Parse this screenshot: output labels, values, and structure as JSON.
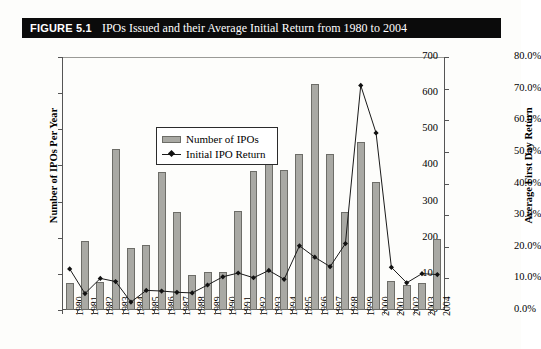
{
  "figure": {
    "label": "FIGURE 5.1",
    "title": "IPOs Issued and their Average Initial Return from 1980 to 2004"
  },
  "legend": {
    "bar_series_label": "Number of IPOs",
    "line_series_label": "Initial IPO Return"
  },
  "axes": {
    "left_title": "Number of IPOs Per Year",
    "right_title": "Average First Day Return",
    "left_ticks": [
      "0",
      "100",
      "200",
      "300",
      "400",
      "500",
      "600",
      "700"
    ],
    "right_ticks": [
      "0.0%",
      "10.0%",
      "20.0%",
      "30.0%",
      "40.0%",
      "50.0%",
      "60.0%",
      "70.0%",
      "80.0%"
    ]
  },
  "chart_data": {
    "type": "bar",
    "title": "IPOs Issued and their Average Initial Return from 1980 to 2004",
    "xlabel": "",
    "ylabel": "Number of IPOs Per Year",
    "y2label": "Average First Day Return",
    "ylim": [
      0,
      700
    ],
    "y2lim": [
      0,
      80
    ],
    "grid": false,
    "legend_position": "upper-left-inside",
    "categories": [
      "1980",
      "1981",
      "1982",
      "1983",
      "1984",
      "1985",
      "1986",
      "1987",
      "1988",
      "1989",
      "1990",
      "1991",
      "1992",
      "1993",
      "1994",
      "1995",
      "1996",
      "1997",
      "1998",
      "1999",
      "2000",
      "2001",
      "2002",
      "2003",
      "2004"
    ],
    "series": [
      {
        "name": "Number of IPOs",
        "type": "bar",
        "axis": "left",
        "unit": "count",
        "values": [
          75,
          192,
          77,
          445,
          172,
          179,
          381,
          271,
          97,
          105,
          104,
          273,
          385,
          483,
          387,
          432,
          625,
          432,
          270,
          464,
          355,
          80,
          70,
          75,
          196
        ]
      },
      {
        "name": "Initial IPO Return",
        "type": "line",
        "axis": "right",
        "unit": "percent",
        "values": [
          13.0,
          5.2,
          10.0,
          9.0,
          2.5,
          6.2,
          6.0,
          5.6,
          5.4,
          7.9,
          10.5,
          11.7,
          10.2,
          12.5,
          9.7,
          20.3,
          16.7,
          13.7,
          21.0,
          71.0,
          56.0,
          13.5,
          8.6,
          11.5,
          11.2
        ]
      }
    ]
  },
  "colors": {
    "bar_fill": "#a9a9a4",
    "bar_edge": "#6d6d68",
    "line": "#1a1a1a",
    "marker": "#111111",
    "axis": "#555555",
    "title_bar_bg": "#0b0b0b",
    "title_bar_fg": "#ffffff"
  }
}
